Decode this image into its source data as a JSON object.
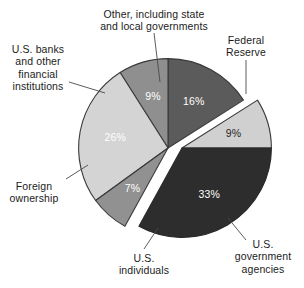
{
  "chart_data": {
    "type": "pie",
    "title": "",
    "subtitle": "",
    "xlabel": "",
    "ylabel": "",
    "legend_position": "none",
    "grid": false,
    "units": "percent",
    "total": 100,
    "exploded_group": [
      "Federal Reserve",
      "U.S. government agencies"
    ],
    "categories": [
      "Other, including state and local governments",
      "Federal Reserve",
      "U.S. government agencies",
      "U.S. individuals",
      "Foreign ownership",
      "U.S. banks and other financial institutions"
    ],
    "values": [
      16,
      9,
      33,
      7,
      26,
      9
    ],
    "slices": [
      {
        "label": "Other, including state\nand local governments",
        "value": 16,
        "value_label": "16%",
        "color": "#5b5b5b",
        "value_text_color": "#ffffff",
        "group": "left"
      },
      {
        "label": "Federal\nReserve",
        "value": 9,
        "value_label": "9%",
        "color": "#d0d0d0",
        "value_text_color": "#1a1a1a",
        "group": "right-exploded"
      },
      {
        "label": "U.S.\ngovernment\nagencies",
        "value": 33,
        "value_label": "33%",
        "color": "#2d2d2d",
        "value_text_color": "#ffffff",
        "group": "right-exploded"
      },
      {
        "label": "U.S.\nindividuals",
        "value": 7,
        "value_label": "7%",
        "color": "#919191",
        "value_text_color": "#ffffff",
        "group": "left"
      },
      {
        "label": "Foreign\nownership",
        "value": 26,
        "value_label": "26%",
        "color": "#d4d4d4",
        "value_text_color": "#ffffff",
        "group": "left"
      },
      {
        "label": "U.S. banks\nand other\nfinancial\ninstitutions",
        "value": 9,
        "value_label": "9%",
        "color": "#8f8f8f",
        "value_text_color": "#ffffff",
        "group": "left"
      }
    ]
  },
  "labels": {
    "other": "Other, including state\nand local governments",
    "federal_reserve": "Federal\nReserve",
    "us_banks": "U.S. banks\nand other\nfinancial\ninstitutions",
    "foreign_ownership": "Foreign\nownership",
    "us_individuals": "U.S.\nindividuals",
    "us_gov_agencies": "U.S.\ngovernment\nagencies"
  },
  "percent_labels": {
    "other": "16%",
    "federal_reserve": "9%",
    "us_banks": "9%",
    "foreign_ownership": "26%",
    "us_individuals": "7%",
    "us_gov_agencies": "33%"
  },
  "colors": {
    "other": "#5b5b5b",
    "federal_reserve": "#d0d0d0",
    "us_banks": "#8f8f8f",
    "foreign_ownership": "#d4d4d4",
    "us_individuals": "#919191",
    "us_gov_agencies": "#2d2d2d",
    "background": "#ffffff",
    "outline": "#333333",
    "leader_line": "#444444"
  },
  "cropped_top_text": " "
}
